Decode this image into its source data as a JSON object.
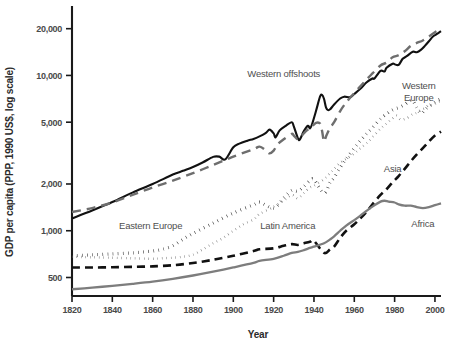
{
  "chart_data": {
    "type": "line",
    "title": "",
    "xlabel": "Year",
    "ylabel": "GDP per capita (PPP, 1990 US$, log scale)",
    "xlim": [
      1820,
      2003
    ],
    "ylim": [
      380,
      28000
    ],
    "yscale": "log",
    "grid": false,
    "legend_position": "inline-annotations",
    "xticks": [
      1820,
      1840,
      1860,
      1880,
      1900,
      1920,
      1940,
      1960,
      1980,
      2000
    ],
    "xtick_labels": [
      "1820",
      "1840",
      "1860",
      "1880",
      "1900",
      "1920",
      "1940",
      "1960",
      "1980",
      "2000"
    ],
    "yticks": [
      500,
      1000,
      2000,
      5000,
      10000,
      20000
    ],
    "ytick_labels": [
      "500",
      "1,000",
      "2,000",
      "5,000",
      "10,000",
      "20,000"
    ],
    "series": [
      {
        "name": "Western offshoots",
        "label": "Western offshoots",
        "color": "#111111",
        "style": "solid",
        "width": 2.1,
        "label_x": 1925,
        "label_y": 9700,
        "label_anchor": "middle",
        "x": [
          1820,
          1830,
          1840,
          1850,
          1860,
          1870,
          1875,
          1880,
          1885,
          1890,
          1893,
          1896,
          1900,
          1903,
          1907,
          1910,
          1913,
          1916,
          1918,
          1920,
          1921,
          1923,
          1926,
          1929,
          1930,
          1932,
          1933,
          1935,
          1937,
          1938,
          1939,
          1941,
          1943,
          1944,
          1945,
          1946,
          1947,
          1948,
          1950,
          1953,
          1955,
          1958,
          1960,
          1963,
          1966,
          1969,
          1970,
          1973,
          1975,
          1976,
          1979,
          1980,
          1982,
          1984,
          1986,
          1989,
          1991,
          1993,
          1995,
          1997,
          1999,
          2001,
          2003
        ],
        "y": [
          1200,
          1350,
          1530,
          1760,
          2000,
          2300,
          2430,
          2570,
          2760,
          2990,
          3000,
          2880,
          3450,
          3640,
          3800,
          3900,
          4050,
          4250,
          4480,
          4230,
          4000,
          4430,
          4740,
          5000,
          4700,
          3950,
          3870,
          4380,
          4740,
          4560,
          4830,
          5900,
          7300,
          7500,
          7050,
          6200,
          5980,
          6050,
          6500,
          7100,
          7300,
          7250,
          7600,
          8200,
          9000,
          9550,
          9550,
          10700,
          10600,
          11200,
          11900,
          11800,
          11700,
          12800,
          13300,
          14200,
          14100,
          14600,
          15500,
          16600,
          17800,
          18500,
          19300
        ]
      },
      {
        "name": "Western Europe",
        "label": "Western\nEurope",
        "color": "#6e6e6e",
        "style": "dashed",
        "width": 2.4,
        "dash": "9,6",
        "label_x": 1992,
        "label_y": 8200,
        "label_anchor": "middle",
        "x": [
          1820,
          1830,
          1840,
          1850,
          1860,
          1870,
          1880,
          1890,
          1900,
          1910,
          1913,
          1916,
          1918,
          1920,
          1922,
          1925,
          1929,
          1930,
          1932,
          1934,
          1936,
          1938,
          1939,
          1941,
          1943,
          1944,
          1945,
          1946,
          1948,
          1950,
          1953,
          1956,
          1960,
          1963,
          1966,
          1969,
          1973,
          1976,
          1979,
          1982,
          1985,
          1988,
          1991,
          1994,
          1997,
          2000,
          2003
        ],
        "y": [
          1320,
          1400,
          1520,
          1700,
          1900,
          2100,
          2350,
          2650,
          3000,
          3350,
          3480,
          3300,
          3150,
          3280,
          3600,
          3880,
          4200,
          4100,
          3880,
          4100,
          4380,
          4580,
          4700,
          4950,
          4900,
          4400,
          3750,
          4050,
          4600,
          5000,
          5900,
          6700,
          7700,
          8500,
          9400,
          10300,
          11600,
          12100,
          13100,
          13500,
          14300,
          15500,
          16200,
          16800,
          17800,
          19000,
          19900
        ]
      },
      {
        "name": "Eastern Europe",
        "label": "Eastern Europe",
        "color": "#161616",
        "style": "dotted",
        "width": 3.2,
        "dash": "0.5,4.6",
        "label_x": 1859,
        "label_y": 1030,
        "label_anchor": "middle",
        "x": [
          1820,
          1830,
          1840,
          1850,
          1860,
          1865,
          1870,
          1875,
          1880,
          1890,
          1900,
          1910,
          1913,
          1920,
          1925,
          1929,
          1932,
          1935,
          1938,
          1940,
          1945,
          1948,
          1950,
          1953,
          1956,
          1960,
          1963,
          1966,
          1969,
          1973,
          1976,
          1979,
          1982,
          1985,
          1987,
          1989,
          1991,
          1993,
          1995,
          1997,
          1999,
          2001,
          2003
        ],
        "y": [
          690,
          700,
          710,
          720,
          740,
          760,
          800,
          880,
          960,
          1120,
          1300,
          1470,
          1530,
          1400,
          1630,
          1820,
          1800,
          1930,
          2100,
          2130,
          1750,
          2050,
          2200,
          2550,
          2900,
          3400,
          3800,
          4200,
          4600,
          5250,
          5650,
          6000,
          6200,
          6500,
          6800,
          6900,
          6200,
          5700,
          6000,
          6350,
          6600,
          6900,
          7050
        ]
      },
      {
        "name": "Latin America",
        "label": "Latin America",
        "color": "#6e6e6e",
        "style": "dotted",
        "width": 2.4,
        "dash": "0.5,4.0",
        "label_x": 1927,
        "label_y": 1030,
        "label_anchor": "middle",
        "x": [
          1820,
          1830,
          1840,
          1850,
          1860,
          1865,
          1870,
          1875,
          1880,
          1885,
          1890,
          1895,
          1900,
          1905,
          1910,
          1913,
          1918,
          1920,
          1925,
          1929,
          1932,
          1935,
          1938,
          1940,
          1945,
          1948,
          1950,
          1953,
          1956,
          1960,
          1963,
          1966,
          1969,
          1973,
          1976,
          1979,
          1981,
          1983,
          1986,
          1989,
          1991,
          1993,
          1995,
          1997,
          1999,
          2001,
          2003
        ],
        "y": [
          680,
          675,
          670,
          665,
          660,
          665,
          670,
          680,
          700,
          760,
          830,
          900,
          1000,
          1100,
          1180,
          1280,
          1380,
          1430,
          1560,
          1700,
          1620,
          1750,
          1900,
          1950,
          2150,
          2350,
          2500,
          2750,
          2900,
          3150,
          3400,
          3650,
          4000,
          4550,
          4900,
          5300,
          5500,
          5200,
          5300,
          5650,
          5750,
          6000,
          6150,
          6450,
          6400,
          6700,
          6850
        ]
      },
      {
        "name": "Asia",
        "label": "Asia",
        "color": "#111111",
        "style": "dashed",
        "width": 2.6,
        "dash": "8,5",
        "label_x": 1979,
        "label_y": 2380,
        "label_anchor": "middle",
        "x": [
          1820,
          1830,
          1840,
          1850,
          1860,
          1870,
          1880,
          1890,
          1900,
          1910,
          1913,
          1920,
          1925,
          1929,
          1932,
          1935,
          1938,
          1940,
          1945,
          1948,
          1950,
          1953,
          1956,
          1960,
          1963,
          1966,
          1969,
          1973,
          1976,
          1979,
          1982,
          1985,
          1988,
          1991,
          1994,
          1997,
          2000,
          2003
        ],
        "y": [
          580,
          580,
          582,
          585,
          590,
          600,
          620,
          650,
          690,
          740,
          760,
          770,
          800,
          820,
          810,
          830,
          850,
          860,
          720,
          760,
          790,
          900,
          1000,
          1100,
          1200,
          1320,
          1480,
          1700,
          1850,
          2050,
          2250,
          2500,
          2800,
          3100,
          3400,
          3750,
          4100,
          4350
        ]
      },
      {
        "name": "Africa",
        "label": "Africa",
        "color": "#7d7d7d",
        "style": "solid",
        "width": 2.3,
        "label_x": 1994,
        "label_y": 1050,
        "label_anchor": "middle",
        "x": [
          1820,
          1830,
          1840,
          1850,
          1860,
          1870,
          1880,
          1890,
          1900,
          1910,
          1913,
          1920,
          1925,
          1929,
          1932,
          1935,
          1938,
          1940,
          1945,
          1948,
          1950,
          1953,
          1956,
          1960,
          1963,
          1966,
          1969,
          1973,
          1975,
          1977,
          1980,
          1982,
          1985,
          1988,
          1991,
          1994,
          1997,
          2000,
          2003
        ],
        "y": [
          420,
          430,
          442,
          455,
          470,
          490,
          515,
          545,
          580,
          620,
          640,
          660,
          690,
          720,
          730,
          750,
          775,
          790,
          830,
          880,
          920,
          1000,
          1080,
          1170,
          1250,
          1340,
          1430,
          1540,
          1560,
          1540,
          1520,
          1480,
          1450,
          1450,
          1420,
          1400,
          1420,
          1460,
          1500
        ]
      }
    ]
  },
  "axes": {
    "x_title": "Year",
    "y_title": "GDP per capita (PPP, 1990 US$, log scale)"
  }
}
